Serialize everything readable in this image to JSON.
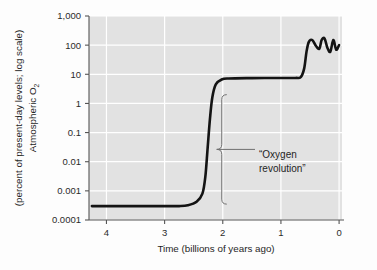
{
  "chart_data": {
    "type": "line",
    "title": "",
    "xlabel": "Time (billions of years ago)",
    "ylabel_line1": "Atmospheric O",
    "ylabel_sub": "2",
    "ylabel_line2": "(percent of present-day levels; log scale)",
    "x_ticks": [
      "4",
      "3",
      "2",
      "1",
      "0"
    ],
    "x_tick_values": [
      4,
      3,
      2,
      1,
      0
    ],
    "xlim": [
      4.3,
      -0.05
    ],
    "x_axis_reversed": true,
    "y_ticks": [
      "1,000",
      "100",
      "10",
      "1",
      "0.1",
      "0.01",
      "0.001",
      "0.0001"
    ],
    "y_tick_values": [
      1000,
      100,
      10,
      1,
      0.1,
      0.01,
      0.001,
      0.0001
    ],
    "ylim": [
      0.0001,
      1000
    ],
    "y_scale": "log",
    "grid": true,
    "grid_color": "#ffffff",
    "plot_background": "#e2e2e2",
    "line_color": "#141414",
    "legend": "none",
    "series": [
      {
        "name": "Atmospheric O2",
        "points": [
          {
            "x": 4.25,
            "y": 0.0003
          },
          {
            "x": 4.0,
            "y": 0.0003
          },
          {
            "x": 3.5,
            "y": 0.0003
          },
          {
            "x": 3.0,
            "y": 0.0003
          },
          {
            "x": 2.75,
            "y": 0.0003
          },
          {
            "x": 2.6,
            "y": 0.00032
          },
          {
            "x": 2.45,
            "y": 0.00042
          },
          {
            "x": 2.35,
            "y": 0.0008
          },
          {
            "x": 2.3,
            "y": 0.003
          },
          {
            "x": 2.26,
            "y": 0.03
          },
          {
            "x": 2.22,
            "y": 0.3
          },
          {
            "x": 2.18,
            "y": 1.6
          },
          {
            "x": 2.12,
            "y": 4.5
          },
          {
            "x": 2.02,
            "y": 6.6
          },
          {
            "x": 1.9,
            "y": 7.2
          },
          {
            "x": 1.5,
            "y": 7.4
          },
          {
            "x": 1.0,
            "y": 7.5
          },
          {
            "x": 0.75,
            "y": 7.5
          },
          {
            "x": 0.66,
            "y": 8.0
          },
          {
            "x": 0.6,
            "y": 16
          },
          {
            "x": 0.56,
            "y": 60
          },
          {
            "x": 0.52,
            "y": 130
          },
          {
            "x": 0.46,
            "y": 150
          },
          {
            "x": 0.4,
            "y": 95
          },
          {
            "x": 0.34,
            "y": 75
          },
          {
            "x": 0.3,
            "y": 150
          },
          {
            "x": 0.25,
            "y": 170
          },
          {
            "x": 0.2,
            "y": 80
          },
          {
            "x": 0.15,
            "y": 60
          },
          {
            "x": 0.1,
            "y": 150
          },
          {
            "x": 0.05,
            "y": 70
          },
          {
            "x": 0.0,
            "y": 100
          }
        ]
      }
    ],
    "annotations": [
      {
        "name": "oxygen-revolution",
        "text_line1": "“Oxygen",
        "text_line2": "revolution”",
        "brace_x_value": 2.0,
        "brace_y_top": 2.0,
        "brace_y_bottom": 0.00035
      }
    ]
  }
}
